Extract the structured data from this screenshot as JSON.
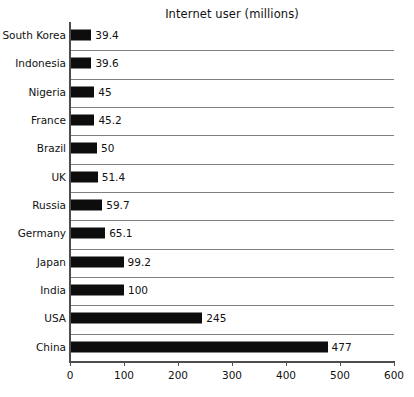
{
  "chart_data": {
    "type": "bar",
    "orientation": "horizontal",
    "title": "Internet user (millions)",
    "xlabel": "",
    "ylabel": "",
    "xlim": [
      0,
      600
    ],
    "xticks": [
      "0",
      "100",
      "200",
      "300",
      "400",
      "500",
      "600"
    ],
    "grid": true,
    "legend": false,
    "bar_color": "#0d0d0d",
    "gridline_color": "#808080",
    "axis_color": "#4d4d4d",
    "background_color": "#ffffff",
    "categories": [
      "South Korea",
      "Indonesia",
      "Nigeria",
      "France",
      "Brazil",
      "UK",
      "Russia",
      "Germany",
      "Japan",
      "India",
      "USA",
      "China"
    ],
    "values": [
      39.4,
      39.6,
      45,
      45.2,
      50,
      51.4,
      59.7,
      65.1,
      99.2,
      100,
      245,
      477
    ],
    "value_labels": [
      "39.4",
      "39.6",
      "45",
      "45.2",
      "50",
      "51.4",
      "59.7",
      "65.1",
      "99.2",
      "100",
      "245",
      "477"
    ]
  }
}
